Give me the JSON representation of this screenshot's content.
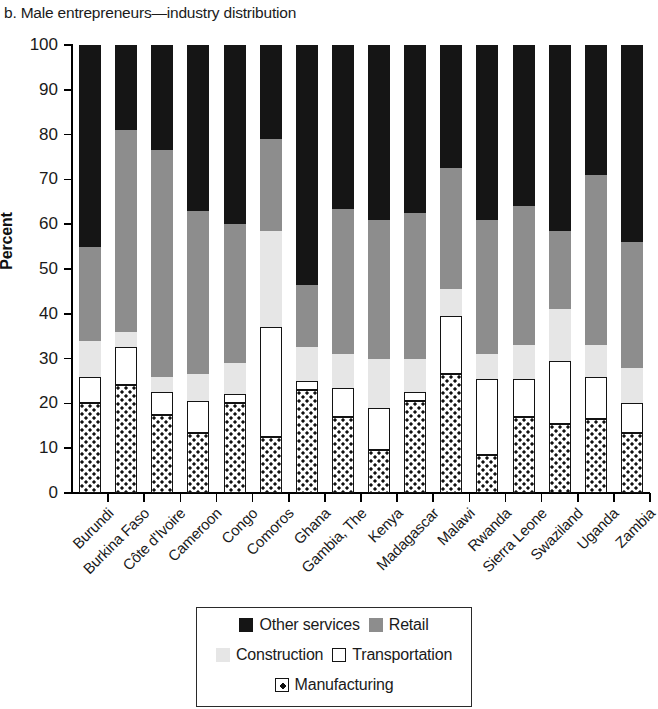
{
  "chart_data": {
    "type": "bar",
    "subtype": "stacked-bar-100-percent",
    "title": "b. Male entrepreneurs—industry distribution",
    "xlabel": "",
    "ylabel": "Percent",
    "ylim": [
      0,
      100
    ],
    "ytick_step": 10,
    "yticks": [
      0,
      10,
      20,
      30,
      40,
      50,
      60,
      70,
      80,
      90,
      100
    ],
    "grid": false,
    "legend_position": "bottom",
    "stack_order_bottom_to_top": [
      "Manufacturing",
      "Transportation",
      "Construction",
      "Retail",
      "Other services"
    ],
    "categories": [
      "Burundi",
      "Burkina Faso",
      "Côte d'Ivoire",
      "Cameroon",
      "Congo",
      "Comoros",
      "Ghana",
      "Gambia, The",
      "Kenya",
      "Madagascar",
      "Malawi",
      "Rwanda",
      "Sierra Leone",
      "Swaziland",
      "Uganda",
      "Zambia"
    ],
    "series": [
      {
        "name": "Manufacturing",
        "color": "#ffffff",
        "pattern": "dotted",
        "values": [
          20.0,
          24.0,
          17.5,
          13.5,
          20.0,
          12.5,
          23.0,
          17.0,
          9.5,
          20.5,
          26.5,
          8.5,
          17.0,
          15.5,
          16.5,
          13.5
        ]
      },
      {
        "name": "Transportation",
        "color": "#ffffff",
        "pattern": "outline",
        "values": [
          6.0,
          8.5,
          5.0,
          7.0,
          2.0,
          24.5,
          2.0,
          6.5,
          9.5,
          2.0,
          13.0,
          17.0,
          8.5,
          14.0,
          9.5,
          6.5
        ]
      },
      {
        "name": "Construction",
        "color": "#e6e6e6",
        "values": [
          8.0,
          3.5,
          3.5,
          6.0,
          7.0,
          21.5,
          7.5,
          7.5,
          11.0,
          7.5,
          6.0,
          5.5,
          7.5,
          11.5,
          7.0,
          8.0
        ]
      },
      {
        "name": "Retail",
        "color": "#8d8d8d",
        "values": [
          21.0,
          45.0,
          50.5,
          36.5,
          31.0,
          20.5,
          14.0,
          32.5,
          31.0,
          32.5,
          27.0,
          30.0,
          31.0,
          17.5,
          38.0,
          28.0
        ]
      },
      {
        "name": "Other services",
        "color": "#151515",
        "values": [
          45.0,
          19.0,
          23.5,
          37.0,
          40.0,
          21.0,
          53.5,
          36.5,
          39.0,
          37.5,
          27.5,
          39.0,
          36.0,
          41.5,
          29.0,
          44.0
        ]
      }
    ],
    "cumulative_tops": [
      {
        "category": "Burundi",
        "manufacturing": 20.0,
        "transportation": 26.0,
        "construction": 34.0,
        "retail": 55.0,
        "other_services": 100
      },
      {
        "category": "Burkina Faso",
        "manufacturing": 24.0,
        "transportation": 32.5,
        "construction": 36.0,
        "retail": 81.0,
        "other_services": 100
      },
      {
        "category": "Côte d'Ivoire",
        "manufacturing": 17.5,
        "transportation": 22.5,
        "construction": 26.0,
        "retail": 76.5,
        "other_services": 100
      },
      {
        "category": "Cameroon",
        "manufacturing": 13.5,
        "transportation": 20.5,
        "construction": 26.5,
        "retail": 63.0,
        "other_services": 100
      },
      {
        "category": "Congo",
        "manufacturing": 20.0,
        "transportation": 22.0,
        "construction": 29.0,
        "retail": 60.0,
        "other_services": 100
      },
      {
        "category": "Comoros",
        "manufacturing": 12.5,
        "transportation": 37.0,
        "construction": 58.5,
        "retail": 79.0,
        "other_services": 100
      },
      {
        "category": "Ghana",
        "manufacturing": 23.0,
        "transportation": 25.0,
        "construction": 32.5,
        "retail": 46.5,
        "other_services": 100
      },
      {
        "category": "Gambia, The",
        "manufacturing": 17.0,
        "transportation": 23.5,
        "construction": 31.0,
        "retail": 63.5,
        "other_services": 100
      },
      {
        "category": "Kenya",
        "manufacturing": 9.5,
        "transportation": 19.0,
        "construction": 30.0,
        "retail": 61.0,
        "other_services": 100
      },
      {
        "category": "Madagascar",
        "manufacturing": 20.5,
        "transportation": 22.5,
        "construction": 30.0,
        "retail": 62.5,
        "other_services": 100
      },
      {
        "category": "Malawi",
        "manufacturing": 26.5,
        "transportation": 39.5,
        "construction": 45.5,
        "retail": 72.5,
        "other_services": 100
      },
      {
        "category": "Rwanda",
        "manufacturing": 8.5,
        "transportation": 25.5,
        "construction": 31.0,
        "retail": 61.0,
        "other_services": 100
      },
      {
        "category": "Sierra Leone",
        "manufacturing": 17.0,
        "transportation": 25.5,
        "construction": 33.0,
        "retail": 64.0,
        "other_services": 100
      },
      {
        "category": "Swaziland",
        "manufacturing": 15.5,
        "transportation": 29.5,
        "construction": 41.0,
        "retail": 58.5,
        "other_services": 100
      },
      {
        "category": "Uganda",
        "manufacturing": 16.5,
        "transportation": 26.0,
        "construction": 33.0,
        "retail": 71.0,
        "other_services": 100
      },
      {
        "category": "Zambia",
        "manufacturing": 13.5,
        "transportation": 20.0,
        "construction": 28.0,
        "retail": 56.0,
        "other_services": 100
      }
    ]
  },
  "legend": {
    "rows": [
      [
        {
          "label": "Other services",
          "key": "other"
        },
        {
          "label": "Retail",
          "key": "retail"
        }
      ],
      [
        {
          "label": "Construction",
          "key": "constr"
        },
        {
          "label": "Transportation",
          "key": "transport"
        }
      ],
      [
        {
          "label": "Manufacturing",
          "key": "manuf"
        }
      ]
    ]
  },
  "colors": {
    "other_services": "#151515",
    "retail": "#8d8d8d",
    "construction": "#e6e6e6",
    "transportation": "#ffffff",
    "manufacturing": "#ffffff",
    "axis": "#000000",
    "text": "#1a1a1a"
  }
}
